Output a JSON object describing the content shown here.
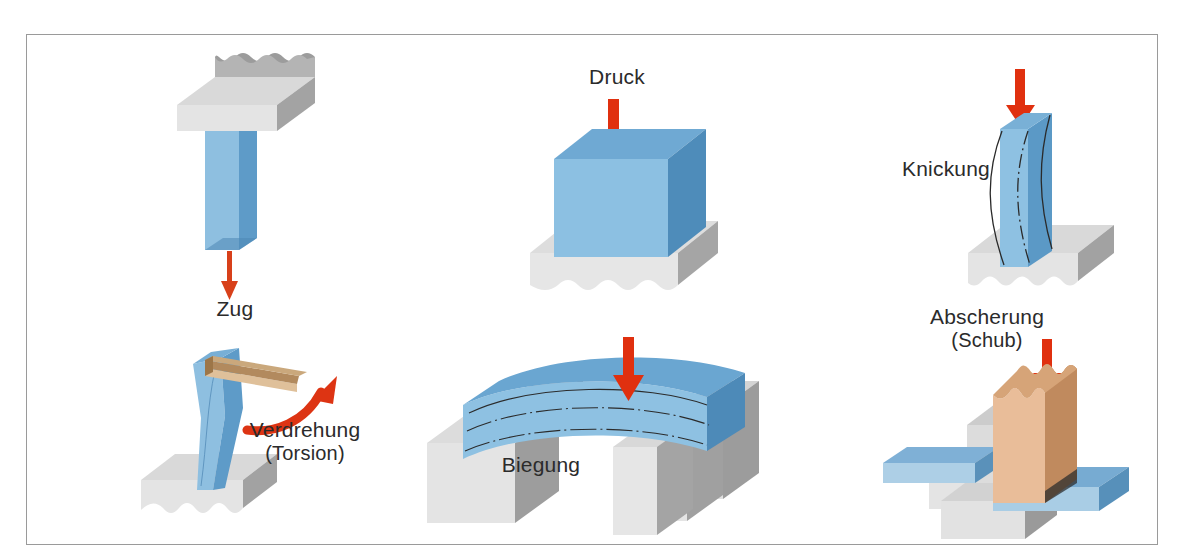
{
  "figure": {
    "title_visible": false,
    "frame": {
      "border_color": "#9a9a9a",
      "background": "#ffffff"
    },
    "palette": {
      "blue_front": "#8bbfe0",
      "blue_top": "#6aa8d4",
      "blue_side": "#3f7fb0",
      "blue_light": "#afd4ea",
      "gray_top": "#e2e2e2",
      "gray_front": "#d4d4d4",
      "gray_side": "#9e9e9e",
      "gray_dark": "#8a8a8a",
      "tan_front": "#e8bb96",
      "tan_top": "#d8a87f",
      "tan_side": "#b9835b",
      "arrow_red": "#e0300f",
      "text": "#2b2b2b"
    }
  },
  "panels": [
    {
      "id": "zug",
      "label": "Zug",
      "label_sub": "",
      "load_type": "tension",
      "arrow": {
        "name": "tension-arrow",
        "direction": "down",
        "color": "#e0300f"
      },
      "elements": [
        "ceiling-block",
        "blue-bar",
        "down-arrow"
      ]
    },
    {
      "id": "druck",
      "label": "Druck",
      "label_sub": "",
      "load_type": "compression",
      "arrow": {
        "name": "compression-arrow",
        "direction": "down",
        "color": "#e0300f"
      },
      "elements": [
        "blue-cube",
        "gray-base",
        "down-arrow"
      ]
    },
    {
      "id": "knickung",
      "label": "Knickung",
      "label_sub": "",
      "load_type": "buckling",
      "arrow": {
        "name": "buckling-arrow",
        "direction": "down",
        "color": "#e0300f"
      },
      "elements": [
        "blue-column",
        "gray-base",
        "buckling-curves",
        "down-arrow"
      ]
    },
    {
      "id": "verdrehung",
      "label": "Verdrehung",
      "label_sub": "(Torsion)",
      "load_type": "torsion",
      "arrow": {
        "name": "torsion-arrow",
        "direction": "curved-clockwise",
        "color": "#e0300f"
      },
      "elements": [
        "twisted-blue-column",
        "gray-base",
        "tan-lever-arm",
        "curved-arrow"
      ]
    },
    {
      "id": "biegung",
      "label": "Biegung",
      "label_sub": "",
      "load_type": "bending",
      "arrow": {
        "name": "bending-arrow",
        "direction": "down",
        "color": "#e0300f"
      },
      "elements": [
        "blue-beam",
        "gray-support-left",
        "gray-support-right",
        "deflection-curves",
        "down-arrow"
      ]
    },
    {
      "id": "abscherung",
      "label": "Abscherung",
      "label_sub": "(Schub)",
      "load_type": "shear",
      "arrow": {
        "name": "shear-arrow",
        "direction": "down",
        "color": "#e0300f"
      },
      "elements": [
        "tan-block",
        "blue-bar-left",
        "blue-bar-right",
        "gray-support",
        "down-arrow"
      ]
    }
  ]
}
